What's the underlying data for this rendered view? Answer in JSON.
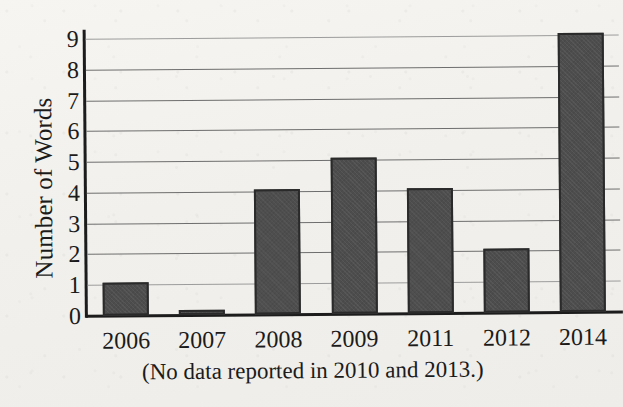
{
  "chart_data": {
    "type": "bar",
    "title": "",
    "xlabel": "",
    "ylabel": "Number of Words",
    "categories": [
      "2006",
      "2007",
      "2008",
      "2009",
      "2011",
      "2012",
      "2014"
    ],
    "values": [
      1,
      0.1,
      4,
      5,
      4,
      2,
      9
    ],
    "ylim": [
      0,
      9
    ],
    "ytick_labels": [
      "0",
      "1",
      "2",
      "3",
      "4",
      "5",
      "6",
      "7",
      "8",
      "9"
    ],
    "yticks": [
      0,
      1,
      2,
      3,
      4,
      5,
      6,
      7,
      8,
      9
    ],
    "grid": true,
    "grid_axis": "y",
    "legend": false,
    "legend_position": "none",
    "caption": "(No data reported in 2010 and 2013.)",
    "bar_color": "#4d4d4d",
    "bar_edge_color": "#2a2a2a",
    "background_color": "#f3f2ee",
    "text_color": "#1b1b1b"
  }
}
